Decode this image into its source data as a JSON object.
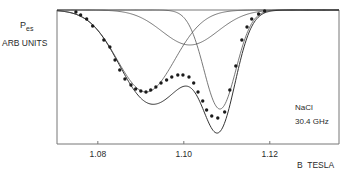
{
  "chart_data": {
    "type": "line",
    "title": "",
    "ylabel_main": "P",
    "ylabel_sub": "es",
    "ylabel_units": "ARB UNITS",
    "xlabel": "B  TESLA",
    "annotation": {
      "sample": "NaCl",
      "frequency": "30.4 GHz"
    },
    "xlim": [
      1.0705,
      1.1361
    ],
    "ylim": [
      0.0,
      1.0
    ],
    "x_ticks": [
      1.08,
      1.1,
      1.12
    ],
    "x_tick_labels": [
      "1.08",
      "1.10",
      "1.12"
    ],
    "grid": false,
    "series": [
      {
        "name": "measured",
        "style": "dots",
        "x": [
          1.0749,
          1.076,
          1.0774,
          1.0788,
          1.0814,
          1.0828,
          1.084,
          1.0851,
          1.0863,
          1.0877,
          1.0888,
          1.09,
          1.0912,
          1.0923,
          1.0935,
          1.0947,
          1.096,
          1.0972,
          1.0986,
          1.0998,
          1.1012,
          1.1023,
          1.1033,
          1.1044,
          1.1053,
          1.1065,
          1.1079,
          1.1095,
          1.1107,
          1.1121,
          1.1135,
          1.1147,
          1.1158,
          1.1174,
          1.1188
        ],
        "y": [
          0.985,
          0.963,
          0.933,
          0.881,
          0.776,
          0.724,
          0.627,
          0.552,
          0.485,
          0.44,
          0.41,
          0.396,
          0.388,
          0.403,
          0.425,
          0.455,
          0.478,
          0.5,
          0.515,
          0.515,
          0.5,
          0.455,
          0.388,
          0.321,
          0.254,
          0.209,
          0.194,
          0.239,
          0.403,
          0.582,
          0.776,
          0.873,
          0.933,
          0.97,
          0.993
        ]
      }
    ],
    "components": [
      {
        "name": "component-a",
        "center": 1.0912,
        "depth": 0.612,
        "sigma": 0.0067
      },
      {
        "name": "component-b",
        "center": 1.1084,
        "depth": 0.739,
        "sigma": 0.0037
      },
      {
        "name": "component-c",
        "center": 1.1014,
        "depth": 0.261,
        "sigma": 0.0065
      }
    ],
    "baseline": 1.0
  },
  "colors": {
    "line": "#555555",
    "dot": "#1a1a1a",
    "axis": "#777777",
    "text": "#2a2a2a"
  }
}
